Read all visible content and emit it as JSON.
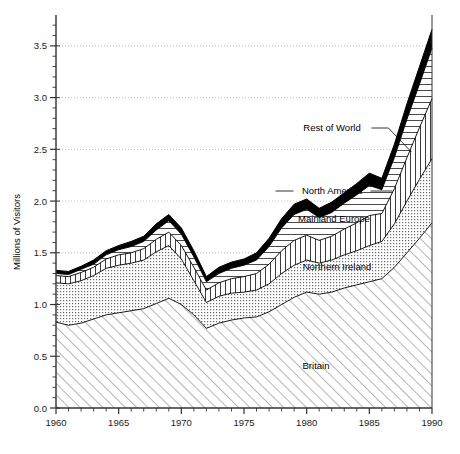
{
  "chart_data": {
    "type": "area",
    "stacked": true,
    "title": "",
    "xlabel": "",
    "ylabel": "Millions of Visitors",
    "xlim": [
      1960,
      1990
    ],
    "ylim": [
      0.0,
      3.75
    ],
    "xticks": [
      1960,
      1965,
      1970,
      1975,
      1980,
      1985,
      1990
    ],
    "xtick_labels": [
      "1960",
      "1965",
      "1970",
      "1975",
      "1980",
      "1985",
      "1990"
    ],
    "xtick_minor_step": 1,
    "yticks": [
      0.0,
      0.5,
      1.0,
      1.5,
      2.0,
      2.5,
      3.0,
      3.5
    ],
    "ytick_labels": [
      "0.0",
      "0.5",
      "1.0",
      "1.5",
      "2.0",
      "2.5",
      "3.0",
      "3.5"
    ],
    "ytick_minor_step": 0.1,
    "grid": "horizontal-dotted-at-major-y",
    "legend_position": "inline-annotations",
    "x": [
      1960,
      1961,
      1962,
      1963,
      1964,
      1965,
      1966,
      1967,
      1968,
      1969,
      1970,
      1971,
      1972,
      1973,
      1974,
      1975,
      1976,
      1977,
      1978,
      1979,
      1980,
      1981,
      1982,
      1983,
      1984,
      1985,
      1986,
      1987,
      1988,
      1989,
      1990
    ],
    "series": [
      {
        "name": "Britain",
        "fill": "diagonal-hatch",
        "values": [
          0.83,
          0.8,
          0.82,
          0.86,
          0.9,
          0.92,
          0.94,
          0.96,
          1.01,
          1.06,
          1.0,
          0.9,
          0.77,
          0.82,
          0.85,
          0.87,
          0.88,
          0.93,
          1.0,
          1.07,
          1.12,
          1.1,
          1.12,
          1.16,
          1.19,
          1.22,
          1.25,
          1.36,
          1.5,
          1.64,
          1.79
        ]
      },
      {
        "name": "Northern Ireland",
        "fill": "fine-dot-stipple",
        "values": [
          0.38,
          0.4,
          0.41,
          0.42,
          0.45,
          0.46,
          0.46,
          0.47,
          0.5,
          0.51,
          0.44,
          0.33,
          0.25,
          0.26,
          0.26,
          0.25,
          0.26,
          0.27,
          0.3,
          0.31,
          0.31,
          0.3,
          0.31,
          0.32,
          0.33,
          0.35,
          0.36,
          0.42,
          0.5,
          0.57,
          0.62
        ]
      },
      {
        "name": "Mainland Europe",
        "fill": "vertical-hatch",
        "values": [
          0.07,
          0.07,
          0.08,
          0.08,
          0.09,
          0.1,
          0.1,
          0.11,
          0.12,
          0.13,
          0.13,
          0.13,
          0.12,
          0.13,
          0.14,
          0.15,
          0.16,
          0.19,
          0.22,
          0.24,
          0.24,
          0.22,
          0.23,
          0.25,
          0.27,
          0.29,
          0.27,
          0.34,
          0.42,
          0.5,
          0.58
        ]
      },
      {
        "name": "North America",
        "fill": "horizontal-hatch",
        "values": [
          0.02,
          0.02,
          0.03,
          0.03,
          0.04,
          0.05,
          0.06,
          0.07,
          0.09,
          0.11,
          0.11,
          0.1,
          0.08,
          0.09,
          0.1,
          0.11,
          0.13,
          0.17,
          0.22,
          0.25,
          0.25,
          0.22,
          0.23,
          0.25,
          0.27,
          0.29,
          0.23,
          0.3,
          0.37,
          0.42,
          0.49
        ]
      },
      {
        "name": "Rest of World",
        "fill": "solid-black",
        "values": [
          0.03,
          0.03,
          0.03,
          0.04,
          0.04,
          0.04,
          0.05,
          0.05,
          0.06,
          0.06,
          0.06,
          0.06,
          0.05,
          0.06,
          0.06,
          0.06,
          0.07,
          0.08,
          0.09,
          0.1,
          0.1,
          0.09,
          0.1,
          0.1,
          0.11,
          0.12,
          0.11,
          0.13,
          0.15,
          0.17,
          0.18
        ]
      }
    ],
    "annotations": [
      {
        "label": "Rest of World",
        "x": 332,
        "y": 131,
        "leader": true
      },
      {
        "label": "North America",
        "x": 332,
        "y": 194,
        "leader": true
      },
      {
        "label": "Mainland Europe",
        "x": 334,
        "y": 222,
        "leader": false
      },
      {
        "label": "Northern Ireland",
        "x": 337,
        "y": 270,
        "leader": false
      },
      {
        "label": "Britain",
        "x": 316,
        "y": 369,
        "leader": false
      }
    ]
  },
  "colors": {
    "axis": "#333333",
    "grid": "#aaaaaa",
    "line": "#000000",
    "background": "#ffffff",
    "stipple": "#555555"
  }
}
